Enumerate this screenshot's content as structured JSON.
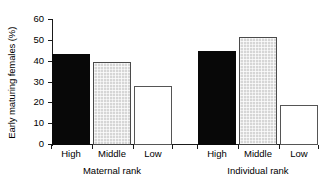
{
  "chart_data": {
    "type": "bar",
    "title": "",
    "xlabel": "",
    "ylabel": "Early maturing females (%)",
    "ylim": [
      0,
      60
    ],
    "yticks": [
      0,
      10,
      20,
      30,
      40,
      50,
      60
    ],
    "ytick_labels": [
      "0",
      "10",
      "20",
      "30",
      "40",
      "50",
      "60"
    ],
    "grid": false,
    "legend": "none",
    "categories": [
      "High",
      "Middle",
      "Low"
    ],
    "groups": [
      {
        "name": "Maternal rank",
        "label": "Maternal rank",
        "bars": [
          {
            "category": "High",
            "value": 43.5,
            "style": "black"
          },
          {
            "category": "Middle",
            "value": 40.0,
            "style": "hatch"
          },
          {
            "category": "Low",
            "value": 28.3,
            "style": "white"
          }
        ]
      },
      {
        "name": "Individual rank",
        "label": "Individual rank",
        "bars": [
          {
            "category": "High",
            "value": 45.0,
            "style": "black"
          },
          {
            "category": "Middle",
            "value": 52.0,
            "style": "hatch"
          },
          {
            "category": "Low",
            "value": 19.0,
            "style": "white"
          }
        ]
      }
    ],
    "series": [
      {
        "name": "Maternal rank",
        "values": [
          43.5,
          40.0,
          28.3
        ]
      },
      {
        "name": "Individual rank",
        "values": [
          45.0,
          52.0,
          19.0
        ]
      }
    ],
    "colors": {
      "high_bar": "#080808",
      "middle_bar": "#d6d6d6",
      "low_bar": "#ffffff",
      "axis": "#1a1a1a",
      "background": "#ffffff"
    }
  }
}
